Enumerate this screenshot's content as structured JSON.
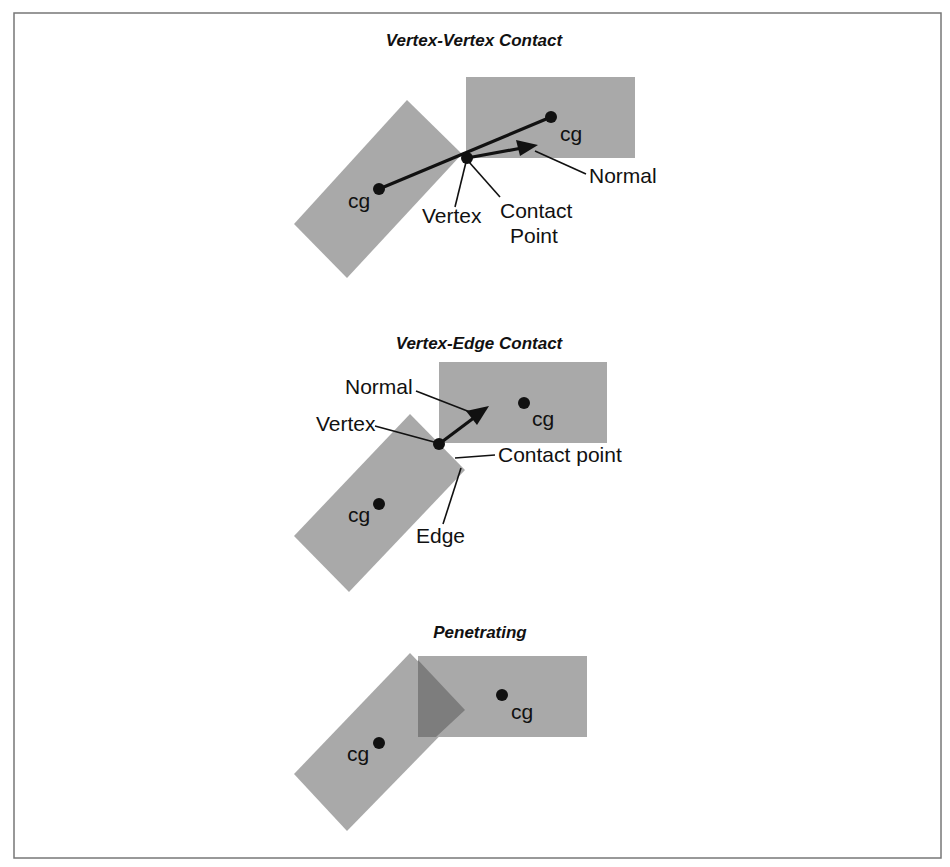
{
  "figure": {
    "panels": [
      {
        "id": "vertex-vertex",
        "title": "Vertex-Vertex Contact",
        "labels": {
          "cg_left": "cg",
          "cg_right": "cg",
          "vertex": "Vertex",
          "contact_line1": "Contact",
          "contact_line2": "Point",
          "normal": "Normal"
        }
      },
      {
        "id": "vertex-edge",
        "title": "Vertex-Edge Contact",
        "labels": {
          "normal": "Normal",
          "vertex": "Vertex",
          "cg_right": "cg",
          "contact": "Contact point",
          "cg_left": "cg",
          "edge": "Edge"
        }
      },
      {
        "id": "penetrating",
        "title": "Penetrating",
        "labels": {
          "cg_right": "cg",
          "cg_left": "cg"
        }
      }
    ],
    "colors": {
      "body_fill": "#a9a9a9",
      "overlap_fill": "#7d7d7d",
      "ink": "#111111",
      "frame": "#777777"
    }
  }
}
